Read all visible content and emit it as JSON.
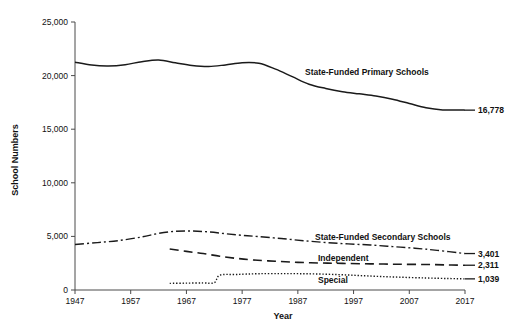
{
  "chart_data": {
    "type": "line",
    "title": "",
    "xlabel": "Year",
    "ylabel": "School Numbers",
    "xlim": [
      1947,
      2017
    ],
    "ylim": [
      0,
      25000
    ],
    "grid": false,
    "legend_position": "inline-right",
    "xticks": [
      "1947",
      "1957",
      "1967",
      "1977",
      "1987",
      "1997",
      "2007",
      "2017"
    ],
    "xtick_values": [
      1947,
      1957,
      1967,
      1977,
      1987,
      1997,
      2007,
      2017
    ],
    "yticks": [
      "0",
      "5,000",
      "10,000",
      "15,000",
      "20,000",
      "25,000"
    ],
    "ytick_values": [
      0,
      5000,
      10000,
      15000,
      20000,
      25000
    ],
    "series": [
      {
        "name": "State-Funded Primary Schools",
        "label": "State-Funded Primary Schools",
        "style": "solid",
        "end_value_label": "16,778",
        "end_value": 16778,
        "x": [
          1947,
          1950,
          1953,
          1956,
          1959,
          1962,
          1965,
          1968,
          1971,
          1974,
          1977,
          1980,
          1983,
          1986,
          1989,
          1992,
          1995,
          1998,
          2001,
          2004,
          2007,
          2010,
          2013,
          2016,
          2017
        ],
        "values": [
          21250,
          20980,
          20900,
          21020,
          21300,
          21450,
          21200,
          20950,
          20850,
          21000,
          21200,
          21150,
          20600,
          19900,
          19200,
          18800,
          18500,
          18300,
          18100,
          17800,
          17400,
          17000,
          16800,
          16790,
          16778
        ]
      },
      {
        "name": "State-Funded Secondary Schools",
        "label": "State-Funded Secondary Schools",
        "style": "dash-dot",
        "end_value_label": "3,401",
        "end_value": 3401,
        "x": [
          1947,
          1951,
          1955,
          1959,
          1962,
          1965,
          1968,
          1971,
          1974,
          1977,
          1980,
          1984,
          1988,
          1992,
          1996,
          2000,
          2004,
          2008,
          2012,
          2017
        ],
        "values": [
          4250,
          4420,
          4620,
          4950,
          5280,
          5480,
          5500,
          5420,
          5250,
          5100,
          4980,
          4800,
          4600,
          4430,
          4300,
          4200,
          4050,
          3900,
          3700,
          3401
        ]
      },
      {
        "name": "Independent",
        "label": "Independent",
        "style": "dash",
        "end_value_label": "2,311",
        "end_value": 2311,
        "x": [
          1964,
          1967,
          1970,
          1973,
          1976,
          1979,
          1983,
          1987,
          1991,
          1995,
          2000,
          2005,
          2010,
          2014,
          2017
        ],
        "values": [
          3820,
          3600,
          3400,
          3150,
          2950,
          2800,
          2680,
          2580,
          2520,
          2480,
          2440,
          2400,
          2380,
          2340,
          2311
        ]
      },
      {
        "name": "Special",
        "label": "Special",
        "style": "dot",
        "end_value_label": "1,039",
        "end_value": 1039,
        "x": [
          1964,
          1967,
          1970,
          1972,
          1973,
          1976,
          1980,
          1985,
          1990,
          1995,
          2000,
          2005,
          2010,
          2014,
          2017
        ],
        "values": [
          620,
          640,
          660,
          680,
          1380,
          1450,
          1520,
          1530,
          1500,
          1420,
          1300,
          1200,
          1120,
          1070,
          1039
        ]
      }
    ],
    "colors": {
      "line": "#1a1a1a",
      "axis": "#4a4a4a",
      "text": "#111111",
      "background": "#ffffff"
    },
    "series_label_positions": [
      {
        "series": "State-Funded Primary Schools",
        "x": 305,
        "y": 75
      },
      {
        "series": "State-Funded Secondary Schools",
        "x": 315,
        "y": 240
      },
      {
        "series": "Independent",
        "x": 318,
        "y": 261
      },
      {
        "series": "Special",
        "x": 318,
        "y": 283
      }
    ]
  }
}
